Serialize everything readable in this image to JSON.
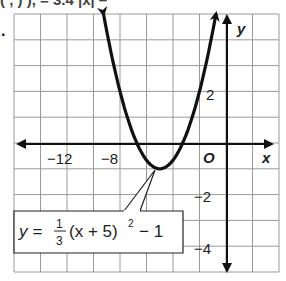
{
  "header": {
    "clipped_text": "(  ,  )            ),   = 3.4  |x|   –",
    "problem_marker": "."
  },
  "graph": {
    "x_axis_label": "x",
    "y_axis_label": "y",
    "origin_label": "O",
    "x_tick_labels": [
      "−12",
      "−8"
    ],
    "y_tick_labels": [
      "2",
      "−2",
      "−4"
    ],
    "equation_label": {
      "lhs": "y =",
      "frac_num": "1",
      "frac_den": "3",
      "rest": "(x + 5)",
      "exp": "2",
      "tail": "− 1"
    }
  },
  "colors": {
    "grid": "#9a9a9a",
    "axis": "#111111",
    "curve": "#111111",
    "text": "#222222"
  },
  "chart_data": {
    "type": "line",
    "title": "",
    "xlabel": "x",
    "ylabel": "y",
    "xlim": [
      -16,
      4
    ],
    "ylim": [
      -5,
      5
    ],
    "grid": true,
    "x_grid_step": 2,
    "y_grid_step": 1,
    "x_tick_labels": [
      -12,
      -8
    ],
    "y_tick_labels": [
      2,
      -2,
      -4
    ],
    "series": [
      {
        "name": "y = 1/3 (x + 5)^2 − 1",
        "function": "y = (1/3)(x+5)^2 - 1",
        "vertex": [
          -5,
          -1
        ],
        "x_intercepts": [
          -6.73,
          -3.27
        ],
        "x": [
          -11.7,
          -11,
          -10,
          -9,
          -8,
          -7,
          -6,
          -5,
          -4,
          -3,
          -2,
          -1,
          1.7
        ],
        "y": [
          14.0,
          11.0,
          7.33,
          4.33,
          2.0,
          0.33,
          -0.67,
          -1.0,
          -0.67,
          0.33,
          2.0,
          4.33,
          14.0
        ],
        "arrows_on_ends": true
      }
    ],
    "annotations": [
      {
        "text": "y = 1/3 (x + 5)^2 − 1",
        "points_to": [
          -5,
          -1
        ]
      }
    ]
  }
}
